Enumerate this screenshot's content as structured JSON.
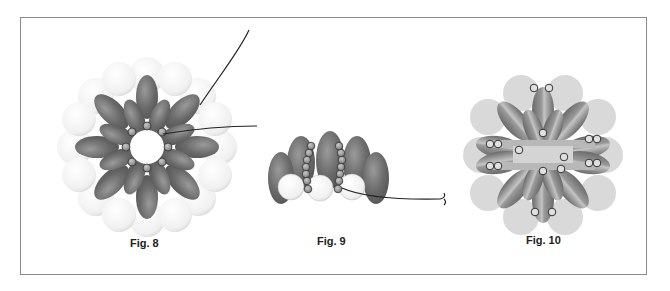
{
  "figures": [
    {
      "id": "fig8",
      "caption": "Fig. 8",
      "description": "Flower ring of gray oval beads with white round beads behind, small seed beads in center ring, thread path with arrows"
    },
    {
      "id": "fig9",
      "caption": "Fig. 9",
      "description": "Side view of oval beads with columns of seed beads and white round beads, thread exiting to the right"
    },
    {
      "id": "fig10",
      "caption": "Fig. 10",
      "description": "Completed flower with light gray round beads, striped oval petals, seed bead pairs and center bar"
    }
  ],
  "colors": {
    "oval_dark": "#6e6e6e",
    "oval_light": "#b0b0b0",
    "round_white": "#f4f4f4",
    "round_light_gray": "#d6d6d6",
    "seed_bead": "#9a9a9a",
    "thread": "#222222",
    "frame_border": "#8a8a8a"
  }
}
